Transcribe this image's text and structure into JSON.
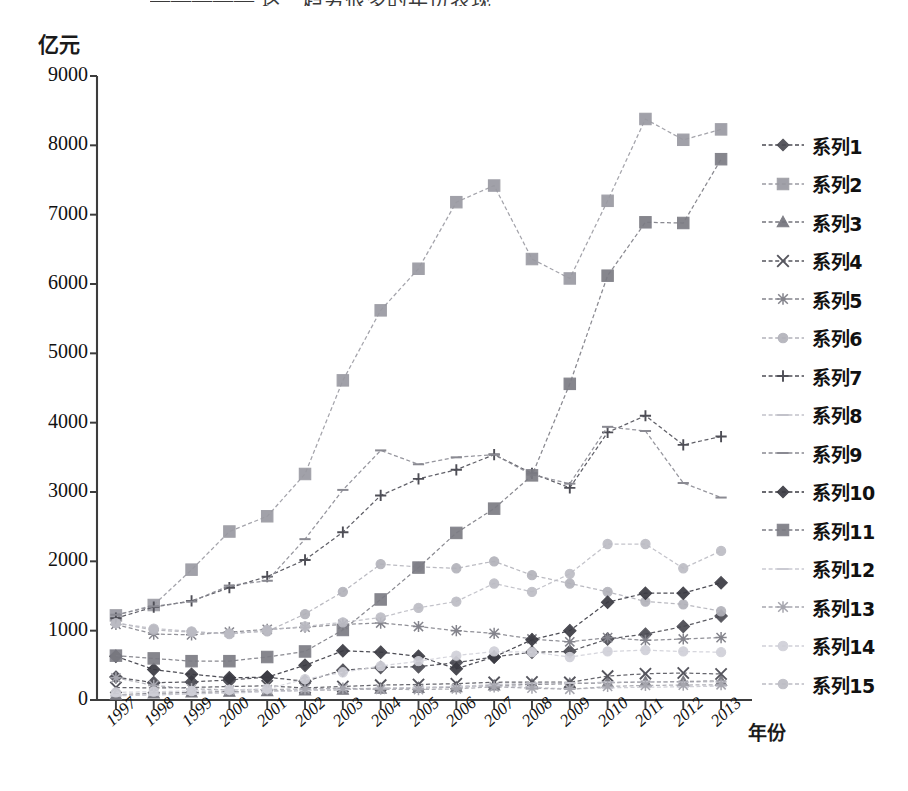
{
  "header": {
    "cut_off_text": "————— 这一趋势很多的年份表现"
  },
  "axes": {
    "y_unit": "亿元",
    "x_unit": "年份",
    "y_ticks": [
      "0",
      "1000",
      "2000",
      "3000",
      "4000",
      "5000",
      "6000",
      "7000",
      "8000",
      "9000"
    ],
    "x_ticks": [
      "1997",
      "1998",
      "1999",
      "2000",
      "2001",
      "2002",
      "2003",
      "2004",
      "2005",
      "2006",
      "2007",
      "2008",
      "2009",
      "2010",
      "2011",
      "2012",
      "2013"
    ]
  },
  "legend": {
    "items": [
      {
        "label": "系列1",
        "marker": "diamond",
        "color": "#4a4a52",
        "weight": "bold"
      },
      {
        "label": "系列2",
        "marker": "square",
        "color": "#9a9aa2",
        "weight": "normal"
      },
      {
        "label": "系列3",
        "marker": "triangle",
        "color": "#74747c",
        "weight": "normal"
      },
      {
        "label": "系列4",
        "marker": "cross",
        "color": "#55555d",
        "weight": "normal"
      },
      {
        "label": "系列5",
        "marker": "star",
        "color": "#84848c",
        "weight": "normal"
      },
      {
        "label": "系列6",
        "marker": "circle",
        "color": "#b2b2ba",
        "weight": "normal"
      },
      {
        "label": "系列7",
        "marker": "plus",
        "color": "#4e4e56",
        "weight": "normal"
      },
      {
        "label": "系列8",
        "marker": "dash",
        "color": "#c2c2ca",
        "weight": "normal"
      },
      {
        "label": "系列9",
        "marker": "dash",
        "color": "#8a8a92",
        "weight": "normal"
      },
      {
        "label": "系列10",
        "marker": "diamond",
        "color": "#3a3a42",
        "weight": "bold"
      },
      {
        "label": "系列11",
        "marker": "square",
        "color": "#7c7c84",
        "weight": "normal"
      },
      {
        "label": "系列12",
        "marker": "dash",
        "color": "#cacad2",
        "weight": "normal"
      },
      {
        "label": "系列13",
        "marker": "star",
        "color": "#a6a6ae",
        "weight": "normal"
      },
      {
        "label": "系列14",
        "marker": "circle",
        "color": "#d0d0d8",
        "weight": "normal"
      },
      {
        "label": "系列15",
        "marker": "circle",
        "color": "#bcbcc4",
        "weight": "normal"
      }
    ]
  },
  "chart_data": {
    "type": "line",
    "title": "",
    "xlabel": "年份",
    "ylabel": "亿元",
    "ylim": [
      0,
      9000
    ],
    "grid": false,
    "legend_position": "right",
    "x": [
      "1997",
      "1998",
      "1999",
      "2000",
      "2001",
      "2002",
      "2003",
      "2004",
      "2005",
      "2006",
      "2007",
      "2008",
      "2009",
      "2010",
      "2011",
      "2012",
      "2013"
    ],
    "series": [
      {
        "name": "系列1",
        "marker": "diamond",
        "color": "#4a4a52",
        "values": [
          330,
          250,
          260,
          290,
          330,
          270,
          430,
          470,
          480,
          540,
          620,
          690,
          700,
          880,
          950,
          1060,
          1210
        ]
      },
      {
        "name": "系列2",
        "marker": "square",
        "color": "#9a9aa2",
        "values": [
          1220,
          1370,
          1880,
          2430,
          2650,
          3260,
          4610,
          5620,
          6220,
          7180,
          7420,
          6360,
          6080,
          7200,
          8380,
          8080,
          8230
        ]
      },
      {
        "name": "系列3",
        "marker": "triangle",
        "color": "#74747c",
        "values": [
          75,
          95,
          110,
          120,
          130,
          140,
          150,
          165,
          175,
          185,
          210,
          225,
          235,
          250,
          260,
          265,
          275
        ]
      },
      {
        "name": "系列4",
        "marker": "cross",
        "color": "#55555d",
        "values": [
          180,
          175,
          180,
          195,
          205,
          175,
          195,
          215,
          225,
          235,
          255,
          260,
          255,
          345,
          380,
          390,
          375
        ]
      },
      {
        "name": "系列5",
        "marker": "star",
        "color": "#84848c",
        "values": [
          1090,
          950,
          940,
          980,
          1020,
          1050,
          1090,
          1110,
          1060,
          1000,
          960,
          880,
          840,
          900,
          860,
          880,
          900
        ]
      },
      {
        "name": "系列6",
        "marker": "circle",
        "color": "#b2b2ba",
        "values": [
          1110,
          1010,
          980,
          960,
          990,
          1240,
          1560,
          1960,
          1920,
          1900,
          2000,
          1800,
          1680,
          1560,
          1420,
          1380,
          1280
        ]
      },
      {
        "name": "系列7",
        "marker": "plus",
        "color": "#4e4e56",
        "values": [
          1180,
          1340,
          1430,
          1620,
          1780,
          2020,
          2420,
          2950,
          3190,
          3320,
          3540,
          3270,
          3060,
          3860,
          4100,
          3680,
          3800
        ]
      },
      {
        "name": "系列8",
        "marker": "dash",
        "color": "#c2c2ca",
        "values": [
          60,
          70,
          90,
          110,
          125,
          135,
          150,
          165,
          180,
          195,
          225,
          240,
          245,
          255,
          265,
          255,
          265
        ]
      },
      {
        "name": "系列9",
        "marker": "dash",
        "color": "#8a8a92",
        "values": [
          1230,
          1350,
          1420,
          1650,
          1720,
          2320,
          3030,
          3600,
          3400,
          3500,
          3540,
          3250,
          3120,
          3940,
          3880,
          3130,
          2920
        ]
      },
      {
        "name": "系列10",
        "marker": "diamond",
        "color": "#3a3a42",
        "values": [
          630,
          440,
          370,
          320,
          330,
          500,
          710,
          690,
          630,
          450,
          620,
          870,
          1000,
          1410,
          1540,
          1540,
          1690
        ]
      },
      {
        "name": "系列11",
        "marker": "square",
        "color": "#7c7c84",
        "values": [
          640,
          600,
          560,
          560,
          620,
          700,
          1010,
          1450,
          1910,
          2410,
          2760,
          3240,
          4560,
          6120,
          6890,
          6880,
          7800
        ]
      },
      {
        "name": "系列12",
        "marker": "dash",
        "color": "#cacad2",
        "values": [
          70,
          80,
          90,
          100,
          120,
          140,
          160,
          175,
          180,
          195,
          200,
          185,
          160,
          175,
          185,
          190,
          200
        ]
      },
      {
        "name": "系列13",
        "marker": "star",
        "color": "#a6a6ae",
        "values": [
          320,
          210,
          160,
          145,
          150,
          160,
          170,
          155,
          150,
          160,
          190,
          170,
          155,
          195,
          210,
          215,
          220
        ]
      },
      {
        "name": "系列14",
        "marker": "circle",
        "color": "#d0d0d8",
        "values": [
          110,
          120,
          130,
          145,
          160,
          300,
          400,
          490,
          560,
          640,
          700,
          690,
          620,
          700,
          720,
          700,
          690
        ]
      },
      {
        "name": "系列15",
        "marker": "circle",
        "color": "#bcbcc4",
        "values": [
          1110,
          1030,
          990,
          950,
          1010,
          1060,
          1120,
          1190,
          1330,
          1420,
          1680,
          1560,
          1820,
          2250,
          2250,
          1900,
          2150
        ]
      }
    ]
  }
}
